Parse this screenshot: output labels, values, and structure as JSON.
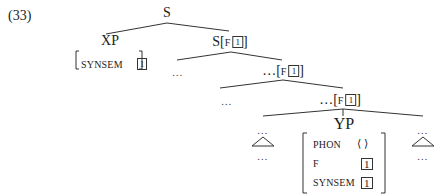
{
  "example_number": "(33)",
  "tree": {
    "root": "S",
    "xp": {
      "label": "XP",
      "avm": [
        {
          "attr": "SYNSEM",
          "value": "1"
        }
      ]
    },
    "s_f": {
      "category": "S",
      "feature": "F",
      "tag": "1"
    },
    "level2_left": "…",
    "level2_right": {
      "prefix": "…",
      "feature": "F",
      "tag": "1"
    },
    "level3_left": "…",
    "level3_right": {
      "prefix": "…",
      "feature": "F",
      "tag": "1"
    },
    "yp": {
      "label": "YP",
      "avm": [
        {
          "attr": "PHON",
          "value": "⟨ ⟩"
        },
        {
          "attr": "F",
          "value": "1"
        },
        {
          "attr": "SYNSEM",
          "value": "1"
        }
      ]
    },
    "left_sister": {
      "top": "…",
      "bottom": "…"
    },
    "right_sister": {
      "top": "…",
      "bottom": "…"
    }
  }
}
